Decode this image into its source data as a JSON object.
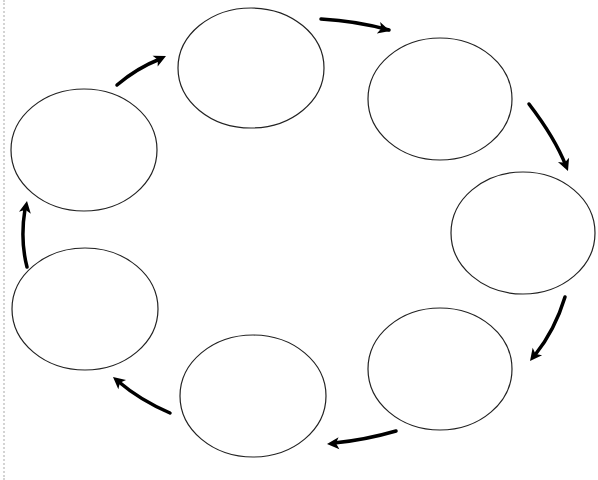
{
  "diagram": {
    "type": "cycle",
    "direction": "clockwise",
    "node_count": 7,
    "colors": {
      "background": "#ffffff",
      "stroke": "#222222",
      "arrow": "#000000",
      "edge_line": "#d4d4d4"
    },
    "nodes": [
      {
        "id": "node-1",
        "label": "",
        "cx": 251,
        "cy": 68,
        "rx": 73,
        "ry": 60
      },
      {
        "id": "node-2",
        "label": "",
        "cx": 440,
        "cy": 99,
        "rx": 72,
        "ry": 61
      },
      {
        "id": "node-3",
        "label": "",
        "cx": 523,
        "cy": 233,
        "rx": 72,
        "ry": 61
      },
      {
        "id": "node-4",
        "label": "",
        "cx": 440,
        "cy": 369,
        "rx": 72,
        "ry": 61
      },
      {
        "id": "node-5",
        "label": "",
        "cx": 253,
        "cy": 396,
        "rx": 73,
        "ry": 61
      },
      {
        "id": "node-6",
        "label": "",
        "cx": 85,
        "cy": 309,
        "rx": 73,
        "ry": 61
      },
      {
        "id": "node-7",
        "label": "",
        "cx": 84,
        "cy": 150,
        "rx": 73,
        "ry": 61
      }
    ],
    "arrows": [
      {
        "id": "arrow-1-2",
        "from": "node-1",
        "to": "node-2",
        "path": "M321,19 Q357,21 389,30",
        "tip": [
          390,
          31
        ],
        "angle": 16
      },
      {
        "id": "arrow-2-3",
        "from": "node-2",
        "to": "node-3",
        "path": "M529,104 Q555,138 566,166",
        "tip": [
          568,
          171
        ],
        "angle": 68
      },
      {
        "id": "arrow-3-4",
        "from": "node-3",
        "to": "node-4",
        "path": "M565,297 Q555,330 535,355",
        "tip": [
          530,
          361
        ],
        "angle": 128
      },
      {
        "id": "arrow-4-5",
        "from": "node-4",
        "to": "node-5",
        "path": "M396,431 Q365,440 334,443",
        "tip": [
          327,
          444
        ],
        "angle": 176
      },
      {
        "id": "arrow-5-6",
        "from": "node-5",
        "to": "node-6",
        "path": "M170,413 Q140,400 119,382",
        "tip": [
          113,
          377
        ],
        "angle": 220
      },
      {
        "id": "arrow-6-7",
        "from": "node-6",
        "to": "node-7",
        "path": "M27,267 Q20,240 25,209",
        "tip": [
          27,
          201
        ],
        "angle": 280
      },
      {
        "id": "arrow-7-1",
        "from": "node-7",
        "to": "node-1",
        "path": "M117,85 Q137,68 160,59",
        "tip": [
          166,
          56
        ],
        "angle": 335
      }
    ]
  }
}
